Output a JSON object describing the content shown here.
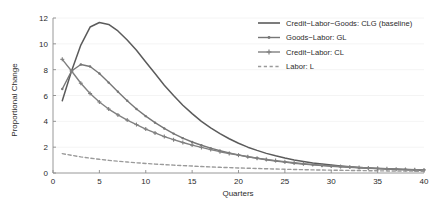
{
  "chart_data": {
    "type": "line",
    "title": "",
    "xlabel": "Quarters",
    "ylabel": "Proportional Change",
    "xlim": [
      0,
      40
    ],
    "ylim": [
      0,
      12
    ],
    "xticks": [
      0,
      5,
      10,
      15,
      20,
      25,
      30,
      35,
      40
    ],
    "yticks": [
      0,
      2,
      4,
      6,
      8,
      10,
      12
    ],
    "grid": true,
    "legend_position": "top-right",
    "x": [
      1,
      2,
      3,
      4,
      5,
      6,
      7,
      8,
      9,
      10,
      11,
      12,
      13,
      14,
      15,
      16,
      17,
      18,
      19,
      20,
      21,
      22,
      23,
      24,
      25,
      26,
      27,
      28,
      29,
      30,
      31,
      32,
      33,
      34,
      35,
      36,
      37,
      38,
      39,
      40
    ],
    "series": [
      {
        "name": "Credit-Labor-Goods: CLG (baseline)",
        "key": "CLG",
        "color": "#5b5b5b",
        "style": "solid",
        "marker": "none",
        "values": [
          5.6,
          7.9,
          9.9,
          11.3,
          11.65,
          11.5,
          11.0,
          10.3,
          9.5,
          8.6,
          7.7,
          6.8,
          6.0,
          5.25,
          4.6,
          4.0,
          3.5,
          3.05,
          2.65,
          2.3,
          2.0,
          1.75,
          1.52,
          1.33,
          1.16,
          1.01,
          0.89,
          0.78,
          0.69,
          0.61,
          0.54,
          0.48,
          0.43,
          0.39,
          0.35,
          0.32,
          0.29,
          0.26,
          0.24,
          0.22
        ]
      },
      {
        "name": "Goods-Labor: GL",
        "key": "GL",
        "color": "#767676",
        "style": "solid",
        "marker": "dot",
        "values": [
          6.5,
          7.9,
          8.4,
          8.25,
          7.7,
          7.0,
          6.3,
          5.6,
          4.95,
          4.4,
          3.9,
          3.45,
          3.05,
          2.7,
          2.4,
          2.15,
          1.92,
          1.72,
          1.55,
          1.4,
          1.26,
          1.14,
          1.03,
          0.93,
          0.84,
          0.76,
          0.69,
          0.63,
          0.57,
          0.52,
          0.48,
          0.44,
          0.4,
          0.37,
          0.34,
          0.31,
          0.29,
          0.27,
          0.25,
          0.23
        ]
      },
      {
        "name": "Credit-Labor: CL",
        "key": "CL",
        "color": "#808080",
        "style": "solid",
        "marker": "plus",
        "values": [
          8.8,
          7.9,
          6.95,
          6.15,
          5.5,
          4.95,
          4.5,
          4.1,
          3.75,
          3.4,
          3.1,
          2.82,
          2.58,
          2.36,
          2.16,
          1.98,
          1.81,
          1.65,
          1.51,
          1.38,
          1.26,
          1.15,
          1.05,
          0.96,
          0.87,
          0.79,
          0.72,
          0.66,
          0.6,
          0.55,
          0.5,
          0.46,
          0.42,
          0.39,
          0.36,
          0.33,
          0.3,
          0.28,
          0.26,
          0.24
        ]
      },
      {
        "name": "Labor: L",
        "key": "L",
        "color": "#9a9a9a",
        "style": "dashed",
        "marker": "none",
        "values": [
          1.5,
          1.37,
          1.25,
          1.15,
          1.06,
          0.98,
          0.91,
          0.85,
          0.79,
          0.74,
          0.69,
          0.65,
          0.61,
          0.57,
          0.54,
          0.5,
          0.47,
          0.44,
          0.42,
          0.39,
          0.37,
          0.35,
          0.33,
          0.31,
          0.29,
          0.27,
          0.26,
          0.24,
          0.23,
          0.22,
          0.21,
          0.2,
          0.19,
          0.18,
          0.17,
          0.16,
          0.15,
          0.15,
          0.14,
          0.13
        ]
      }
    ]
  },
  "legend": {
    "entries": [
      {
        "label": "Credit−Labor−Goods: CLG (baseline)"
      },
      {
        "label": "Goods−Labor: GL"
      },
      {
        "label": "Credit−Labor: CL"
      },
      {
        "label": "Labor: L"
      }
    ]
  },
  "axes": {
    "x_title": "Quarters",
    "y_title": "Proportional Change",
    "x_tick_labels": [
      "0",
      "5",
      "10",
      "15",
      "20",
      "25",
      "30",
      "35",
      "40"
    ],
    "y_tick_labels": [
      "0",
      "2",
      "4",
      "6",
      "8",
      "10",
      "12"
    ]
  }
}
